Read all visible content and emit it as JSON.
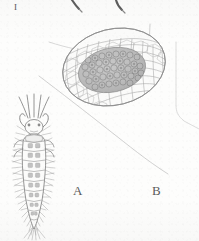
{
  "figure": {
    "plate_label": "I",
    "background_color": "#fdfdfc",
    "ink_color": "#6f6f6f",
    "dark_ink_color": "#4a4a4a",
    "shade_color": "#b9b9b9",
    "width": 199,
    "height": 241,
    "panels": [
      {
        "id": "A",
        "label": "A",
        "subject": "insect-larva-dorsal-view",
        "label_x": 73,
        "label_y": 184
      },
      {
        "id": "B",
        "label": "B",
        "subject": "reticulate-cocoon-with-egg-cluster",
        "label_x": 152,
        "label_y": 184
      }
    ],
    "elements": {
      "top_strokes": "two-dark-diagonal-strokes-cropped-at-top-edge",
      "substrate_line": "long-faint-diagonal-line-upper-left-to-lower-right",
      "right_margin_line": "faint-vertical-line-bending-at-lower-right",
      "cocoon_stalk": "thin-vertical-filament-above-cocoon",
      "cocoon_tendril": "thin-line-extending-to-upper-left-of-cocoon"
    }
  }
}
